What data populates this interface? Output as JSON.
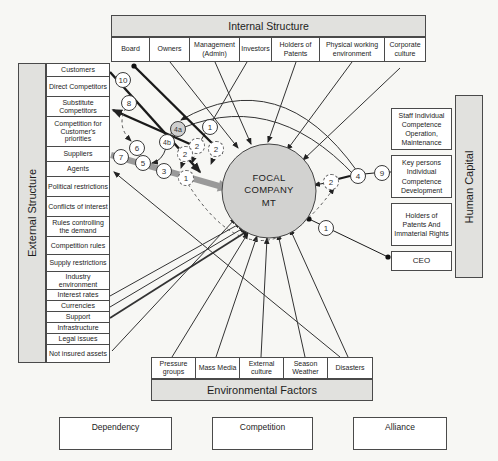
{
  "internal": {
    "title": "Internal Structure",
    "cells": [
      "Board",
      "Owners",
      "Management (Admin)",
      "Investors",
      "Holders of Patents",
      "Physical working environment",
      "Corporate culture"
    ]
  },
  "external": {
    "title": "External Structure",
    "items": [
      "Customers",
      "Direct Competitors",
      "Substitute Competitors",
      "Competition for Customer's priorities",
      "Suppliers",
      "Agents",
      "Political restrictions",
      "Conflicts of interest",
      "Rules controlling the demand",
      "Competition rules",
      "Supply restrictions",
      "Industry environment",
      "Interest rates",
      "Currencies",
      "Support",
      "Infrastructure",
      "Legal issues",
      "Not insured assets"
    ]
  },
  "human": {
    "title": "Human Capital",
    "boxes": [
      "Staff Individual Competence Operation, Maintenance",
      "Key persons Individual Competence Development",
      "Holders of Patents And Immaterial Rights",
      "CEO"
    ]
  },
  "env": {
    "title": "Environmental Factors",
    "cells": [
      "Pressure groups",
      "Mass Media",
      "External culture",
      "Season Weather",
      "Disasters"
    ]
  },
  "focal": {
    "label": "FOCAL COMPANY MT"
  },
  "badges": {
    "n10": "10",
    "n8": "8",
    "n7": "7",
    "n6": "6",
    "n5": "5",
    "n3": "3",
    "n1l": "1",
    "n4a": "4a",
    "n4b": "4b",
    "n2a": "2",
    "n2b": "2",
    "n2c": "2",
    "n1t": "1",
    "n2r": "2",
    "n4r": "4",
    "n9r": "9",
    "n1r": "1"
  },
  "legend": [
    {
      "label": "Dependency"
    },
    {
      "label": "Competition"
    },
    {
      "label": "Alliance"
    }
  ],
  "colors": {
    "band": "#e1e1de",
    "circle": "#d2d2d0",
    "line": "#222222",
    "gray_arrow": "#9a9a9a"
  }
}
